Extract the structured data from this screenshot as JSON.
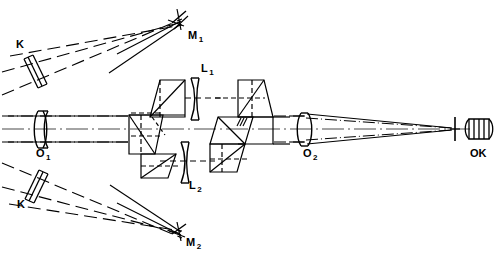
{
  "figure": {
    "kind": "optical-system-diagram",
    "background_color": "#ffffff",
    "line_color": "#000000",
    "width": 499,
    "height": 259
  },
  "labels": [
    {
      "id": "K-upper",
      "base": "K",
      "sub": "",
      "x": 16,
      "y": 39,
      "name": "label-k-upper"
    },
    {
      "id": "M1",
      "base": "M",
      "sub": "1",
      "x": 188,
      "y": 30,
      "name": "label-mirror-m1"
    },
    {
      "id": "L1",
      "base": "L",
      "sub": "1",
      "x": 201,
      "y": 63,
      "name": "label-lens-l1"
    },
    {
      "id": "O1",
      "base": "O",
      "sub": "1",
      "x": 36,
      "y": 148,
      "name": "label-objective-o1"
    },
    {
      "id": "O2",
      "base": "O",
      "sub": "2",
      "x": 303,
      "y": 148,
      "name": "label-objective-o2"
    },
    {
      "id": "OK",
      "base": "OK",
      "sub": "",
      "x": 470,
      "y": 148,
      "name": "label-eyepiece-ok"
    },
    {
      "id": "L2",
      "base": "L",
      "sub": "2",
      "x": 189,
      "y": 180,
      "name": "label-lens-l2"
    },
    {
      "id": "K-lower",
      "base": "K",
      "sub": "",
      "x": 17,
      "y": 199,
      "name": "label-k-lower"
    },
    {
      "id": "M2",
      "base": "M",
      "sub": "2",
      "x": 186,
      "y": 237,
      "name": "label-mirror-m2"
    }
  ],
  "components": {
    "k_upper": {
      "type": "tilted-lens-window",
      "name": "window-k-upper"
    },
    "k_lower": {
      "type": "tilted-lens-window",
      "name": "window-k-lower"
    },
    "m1": {
      "type": "plane-mirror",
      "name": "mirror-m1"
    },
    "m2": {
      "type": "plane-mirror",
      "name": "mirror-m2"
    },
    "o1": {
      "type": "cemented-doublet-objective",
      "name": "objective-o1"
    },
    "o2": {
      "type": "singlet-objective",
      "name": "objective-o2"
    },
    "l1": {
      "type": "negative-meniscus-lens",
      "name": "lens-l1"
    },
    "l2": {
      "type": "negative-meniscus-lens",
      "name": "lens-l2"
    },
    "prism_a": {
      "type": "rhomboid-prism",
      "name": "prism-upper-left"
    },
    "prism_b": {
      "type": "rhomboid-prism",
      "name": "prism-lower-left"
    },
    "prism_c": {
      "type": "rhomboid-prism",
      "name": "prism-upper-right"
    },
    "prism_d": {
      "type": "rhomboid-prism",
      "name": "prism-lower-right"
    },
    "reticle": {
      "type": "field-stop-reticle",
      "name": "reticle-bar"
    },
    "ok": {
      "type": "eyepiece-barrel",
      "name": "eyepiece-ok"
    },
    "axis": {
      "type": "optical-axis",
      "name": "optical-axis-line"
    }
  }
}
